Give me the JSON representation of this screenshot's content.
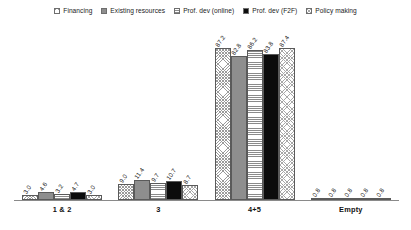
{
  "chart_data": {
    "type": "bar",
    "title": "",
    "subtitle": "",
    "xlabel": "",
    "ylabel": "",
    "ylim": [
      0,
      100
    ],
    "grid": false,
    "legend_position": "top-center",
    "categories": [
      "1 & 2",
      "3",
      "4+5",
      "Empty"
    ],
    "series": [
      {
        "name": "Financing",
        "pattern": "crosshatch",
        "values": [
          3.0,
          9.0,
          87.2,
          0.8
        ],
        "labels": [
          "3.0",
          "9.0",
          "87.2",
          "0.8"
        ]
      },
      {
        "name": "Existing resources",
        "pattern": "solid-gray",
        "values": [
          4.6,
          11.4,
          82.8,
          0.8
        ],
        "labels": [
          "4.6",
          "11.4",
          "82.8",
          "0.8"
        ]
      },
      {
        "name": "Prof. dev (online)",
        "pattern": "horizontal-lines",
        "values": [
          3.2,
          9.7,
          86.2,
          0.8
        ],
        "labels": [
          "3.2",
          "9.7",
          "86.2",
          "0.8"
        ]
      },
      {
        "name": "Prof. dev (F2F)",
        "pattern": "solid-black",
        "values": [
          4.7,
          10.7,
          83.8,
          0.8
        ],
        "labels": [
          "4.7",
          "10.7",
          "83.8",
          "0.8"
        ]
      },
      {
        "name": "Policy making",
        "pattern": "crosshatch-light",
        "values": [
          3.0,
          8.7,
          87.4,
          0.8
        ],
        "labels": [
          "3.0",
          "8.7",
          "87.4",
          "0.8"
        ]
      }
    ],
    "colors": {
      "series_1": "#ffffff",
      "series_2": "#8e8e8e",
      "series_3": "#ffffff",
      "series_4": "#0c0c0c",
      "series_5": "#ffffff",
      "axis": "#8a8a8a",
      "text": "#111111",
      "background": "#ffffff"
    }
  }
}
